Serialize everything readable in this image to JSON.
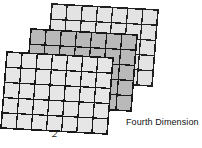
{
  "figure": {
    "name": "fourth-dimension-grid-stack",
    "type": "layered-grid-diagram",
    "background_color": "#ffffff",
    "line_color": "#1f1f1f",
    "labels": {
      "dimension_number": "2",
      "caption": "Fourth Dimension"
    },
    "layers": [
      {
        "id": "back-plane",
        "order": "back",
        "fill_color": "#e3e3e3",
        "stroke_color": "#222222",
        "columns": 7,
        "rows": 5,
        "corners": {
          "top_left": [
            52,
            4
          ],
          "top_right": [
            158,
            10
          ],
          "bottom_right": [
            152,
            86
          ],
          "bottom_left": [
            46,
            80
          ]
        }
      },
      {
        "id": "middle-plane",
        "order": "middle",
        "fill_color": "#b9b9b9",
        "stroke_color": "#1a1a1a",
        "columns": 7,
        "rows": 5,
        "corners": {
          "top_left": [
            31,
            29
          ],
          "top_right": [
            137,
            35
          ],
          "bottom_right": [
            131,
            111
          ],
          "bottom_left": [
            25,
            105
          ]
        }
      },
      {
        "id": "front-plane",
        "order": "front",
        "fill_color": "#e6e6e6",
        "stroke_color": "#1a1a1a",
        "columns": 7,
        "rows": 5,
        "corners": {
          "top_left": [
            7,
            52
          ],
          "top_right": [
            113,
            58
          ],
          "bottom_right": [
            107,
            134
          ],
          "bottom_left": [
            1,
            128
          ]
        }
      }
    ]
  }
}
